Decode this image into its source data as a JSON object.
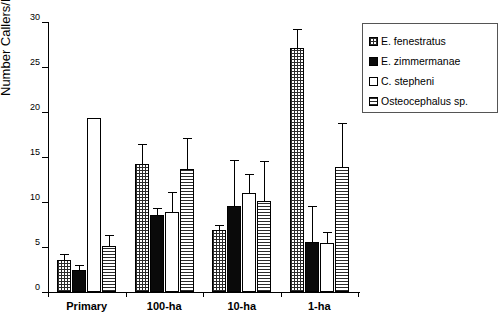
{
  "chart_data": {
    "type": "bar",
    "title": "",
    "xlabel": "",
    "ylabel": "Number Callers/Km",
    "ylim": [
      0,
      30
    ],
    "yticks": [
      0,
      5,
      10,
      15,
      20,
      25,
      30
    ],
    "grid": false,
    "legend_position": "right",
    "categories": [
      "Primary",
      "100-ha",
      "10-ha",
      "1-ha"
    ],
    "series": [
      {
        "name": "E. fenestratus",
        "pattern": "cross-hatch",
        "values": [
          3.6,
          14.2,
          6.9,
          27.1
        ],
        "errors": [
          0.6,
          2.2,
          0.6,
          2.1
        ]
      },
      {
        "name": "E. zimmermanae",
        "pattern": "solid-black",
        "values": [
          2.5,
          8.6,
          9.6,
          5.6
        ],
        "errors": [
          0.5,
          0.7,
          5.1,
          4.0
        ]
      },
      {
        "name": "C. stepheni",
        "pattern": "white",
        "values": [
          19.3,
          8.9,
          11.0,
          5.4
        ],
        "errors": [
          0.0,
          2.2,
          2.1,
          1.3
        ]
      },
      {
        "name": "Osteocephalus sp.",
        "pattern": "horizontal-lines",
        "values": [
          5.1,
          13.7,
          10.1,
          13.9
        ],
        "errors": [
          1.2,
          3.4,
          4.5,
          4.9
        ]
      }
    ]
  },
  "legend": {
    "items": [
      {
        "label": "E. fenestratus"
      },
      {
        "label": "E. zimmermanae"
      },
      {
        "label": "C. stepheni"
      },
      {
        "label": "Osteocephalus sp."
      }
    ]
  }
}
